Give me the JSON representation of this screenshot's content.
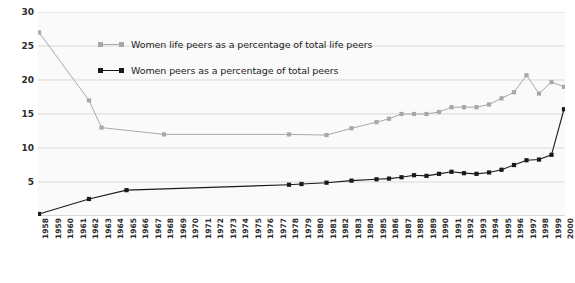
{
  "chart_data": {
    "type": "line",
    "title": "",
    "subtitle": "",
    "xlabel": "",
    "ylabel": "",
    "ylim": [
      0,
      30
    ],
    "yticks": [
      5,
      10,
      15,
      20,
      25,
      30
    ],
    "grid": true,
    "legend_position": "top-center",
    "background": "#fafafa",
    "categories": [
      "1958",
      "1959",
      "1960",
      "1961",
      "1962",
      "1963",
      "1964",
      "1965",
      "1966",
      "1967",
      "1968",
      "1969",
      "1970",
      "1971",
      "1972",
      "1973",
      "1974",
      "1975",
      "1976",
      "1977",
      "1978",
      "1979",
      "1980",
      "1981",
      "1982",
      "1983",
      "1984",
      "1985",
      "1986",
      "1987",
      "1988",
      "1989",
      "1990",
      "1991",
      "1992",
      "1993",
      "1994",
      "1995",
      "1996",
      "1997",
      "1998",
      "1999",
      "2000"
    ],
    "series": [
      {
        "name": "Women life peers as a percentage of total life peers",
        "color": "#a8a8a8",
        "marker": "square",
        "values": [
          27.0,
          null,
          null,
          null,
          17.0,
          13.0,
          null,
          null,
          null,
          null,
          12.0,
          null,
          null,
          null,
          null,
          null,
          null,
          null,
          null,
          null,
          12.0,
          null,
          null,
          11.9,
          null,
          12.9,
          null,
          13.8,
          14.3,
          15.0,
          15.0,
          15.0,
          15.3,
          16.0,
          16.0,
          16.0,
          16.4,
          17.3,
          18.2,
          20.7,
          18.0,
          19.7,
          19.0
        ]
      },
      {
        "name": "Women peers as a percentage of total peers",
        "color": "#1a1a1a",
        "marker": "square",
        "values": [
          0.3,
          null,
          null,
          null,
          2.5,
          null,
          null,
          3.8,
          null,
          null,
          null,
          null,
          null,
          null,
          null,
          null,
          null,
          null,
          null,
          null,
          4.6,
          4.7,
          null,
          4.9,
          null,
          5.2,
          null,
          5.4,
          5.5,
          5.7,
          6.0,
          5.9,
          6.2,
          6.5,
          6.3,
          6.2,
          6.4,
          6.8,
          7.5,
          8.2,
          8.3,
          9.0,
          15.7
        ]
      }
    ]
  },
  "legend": {
    "items": [
      {
        "label": "Women life peers as a percentage of total life peers",
        "color": "#a8a8a8"
      },
      {
        "label": "Women peers as a percentage of total peers",
        "color": "#1a1a1a"
      }
    ]
  }
}
